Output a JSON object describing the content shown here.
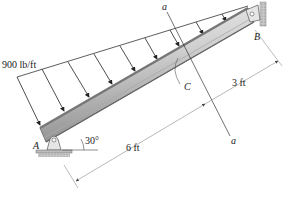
{
  "diagram": {
    "type": "inclined beam with triangular distributed load",
    "load": {
      "label": "900 lb/ft",
      "shape": "triangular",
      "max_at": "A",
      "zero_at": "B"
    },
    "points": {
      "A": "A",
      "B": "B",
      "C": "C"
    },
    "section": {
      "top_label": "a",
      "bottom_label": "a"
    },
    "angle": {
      "label": "30°"
    },
    "dimensions": {
      "AC": "6 ft",
      "CB": "3 ft"
    },
    "colors": {
      "beam_light": "#e4e4e4",
      "beam_dark": "#8a8a8a",
      "line": "#333333",
      "ground": "#9a9a9a"
    }
  }
}
